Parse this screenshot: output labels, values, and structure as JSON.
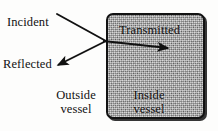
{
  "figure": {
    "background_color": "#fdfdfc"
  },
  "vessel": {
    "name": "vessel",
    "fill_color": "#a3a3a3",
    "border_color": "#121212",
    "texture": "speckled-gray"
  },
  "labels": {
    "incident": "Incident",
    "reflected": "Reflected",
    "transmitted": "Transmitted",
    "outside_line1": "Outside",
    "outside_line2": "vessel",
    "inside_line1": "Inside",
    "inside_line2": "vessel"
  },
  "arrows": [
    {
      "name": "incident-ray",
      "label": "Incident",
      "from": [
        57,
        14
      ],
      "to": [
        106,
        41
      ],
      "arrowhead": "none",
      "color": "#111111"
    },
    {
      "name": "reflected-ray",
      "label": "Reflected",
      "from": [
        106,
        41
      ],
      "to": [
        54,
        67
      ],
      "arrowhead": "end",
      "color": "#111111"
    },
    {
      "name": "transmitted-ray",
      "label": "Transmitted",
      "from": [
        104,
        41
      ],
      "to": [
        173,
        49
      ],
      "arrowhead": "end",
      "color": "#111111"
    }
  ]
}
